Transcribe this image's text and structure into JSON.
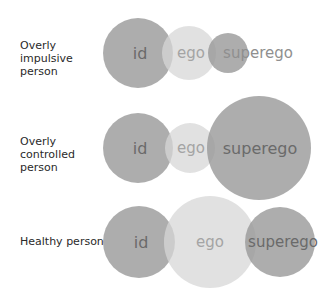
{
  "rows": [
    {
      "label": "Overly impulsive person",
      "label_lines": [
        "Overly impulsive",
        "person"
      ],
      "circles": [
        {
          "name": "id",
          "text": "id",
          "cx": 138,
          "cy": 53,
          "r": 35,
          "tone": "dark"
        },
        {
          "name": "ego",
          "text": "ego",
          "cx": 189,
          "cy": 53,
          "r": 27,
          "tone": "light"
        },
        {
          "name": "superego",
          "text": "superego",
          "cx": 228,
          "cy": 53,
          "r": 20,
          "tone": "dark"
        }
      ]
    },
    {
      "label": "Overly controlled person",
      "label_lines": [
        "Overly controlled",
        "person"
      ],
      "circles": [
        {
          "name": "id",
          "text": "id",
          "cx": 138,
          "cy": 148,
          "r": 35,
          "tone": "dark"
        },
        {
          "name": "ego",
          "text": "ego",
          "cx": 190,
          "cy": 148,
          "r": 25,
          "tone": "light"
        },
        {
          "name": "superego",
          "text": "superego",
          "cx": 259,
          "cy": 148,
          "r": 52,
          "tone": "dark"
        }
      ]
    },
    {
      "label": "Healthy person",
      "label_lines": [
        "Healthy person"
      ],
      "circles": [
        {
          "name": "id",
          "text": "id",
          "cx": 139,
          "cy": 242,
          "r": 36,
          "tone": "dark"
        },
        {
          "name": "ego",
          "text": "ego",
          "cx": 210,
          "cy": 242,
          "r": 46,
          "tone": "light"
        },
        {
          "name": "superego",
          "text": "superego",
          "cx": 280,
          "cy": 242,
          "r": 35,
          "tone": "dark"
        }
      ]
    }
  ],
  "colors": {
    "dark_circle": "#a6a6a6",
    "light_circle": "#dcdcdc",
    "dark_text": "#6a6a6a",
    "light_text": "#a4a4a4",
    "row_label_text": "#2a2a2a"
  }
}
